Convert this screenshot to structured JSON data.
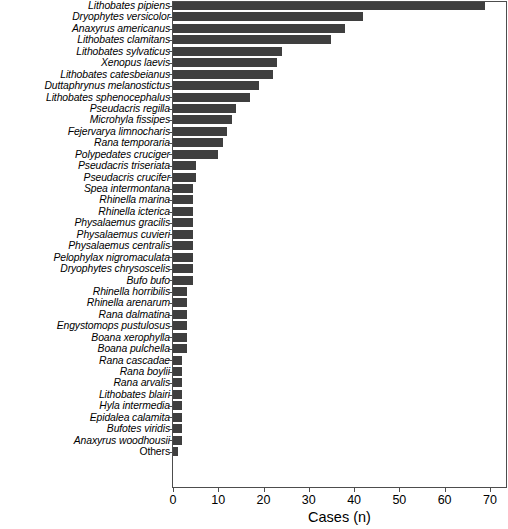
{
  "chart_data": {
    "type": "bar",
    "orientation": "horizontal",
    "title": "",
    "xlabel": "Cases (n)",
    "ylabel": "",
    "xlim": [
      0,
      74
    ],
    "xticks": [
      0,
      10,
      20,
      30,
      40,
      50,
      60,
      70
    ],
    "grid": false,
    "legend": null,
    "bar_color": "#3f3f3f",
    "categories": [
      "Lithobates pipiens",
      "Dryophytes versicolor",
      "Anaxyrus americanus",
      "Lithobates clamitans",
      "Lithobates sylvaticus",
      "Xenopus laevis",
      "Lithobates catesbeianus",
      "Duttaphrynus melanostictus",
      "Lithobates sphenocephalus",
      "Pseudacris regilla",
      "Microhyla fissipes",
      "Fejervarya limnocharis",
      "Rana temporaria",
      "Polypedates cruciger",
      "Pseudacris triseriata",
      "Pseudacris crucifer",
      "Spea intermontana",
      "Rhinella marina",
      "Rhinella icterica",
      "Physalaemus gracilis",
      "Physalaemus cuvieri",
      "Physalaemus centralis",
      "Pelophylax nigromaculata",
      "Dryophytes chrysoscelis",
      "Bufo bufo",
      "Rhinella horribilis",
      "Rhinella arenarum",
      "Rana dalmatina",
      "Engystomops pustulosus",
      "Boana xerophylla",
      "Boana pulchella",
      "Rana cascadae",
      "Rana boylii",
      "Rana arvalis",
      "Lithobates blairi",
      "Hyla intermedia",
      "Epidalea calamita",
      "Bufotes viridis",
      "Anaxyrus woodhousii",
      "Others"
    ],
    "values": [
      69,
      42,
      38,
      35,
      24,
      23,
      22,
      19,
      17,
      14,
      13,
      12,
      11,
      10,
      5,
      5,
      4.5,
      4.5,
      4.5,
      4.5,
      4.5,
      4.5,
      4.5,
      4.5,
      4.5,
      3,
      3,
      3,
      3,
      3,
      3,
      2,
      2,
      2,
      2,
      2,
      2,
      2,
      2,
      1
    ],
    "category_styles": [
      "italic",
      "italic",
      "italic",
      "italic",
      "italic",
      "italic",
      "italic",
      "italic",
      "italic",
      "italic",
      "italic",
      "italic",
      "italic",
      "italic",
      "italic",
      "italic",
      "italic",
      "italic",
      "italic",
      "italic",
      "italic",
      "italic",
      "italic",
      "italic",
      "italic",
      "italic",
      "italic",
      "italic",
      "italic",
      "italic",
      "italic",
      "italic",
      "italic",
      "italic",
      "italic",
      "italic",
      "italic",
      "italic",
      "italic",
      "plain"
    ]
  }
}
